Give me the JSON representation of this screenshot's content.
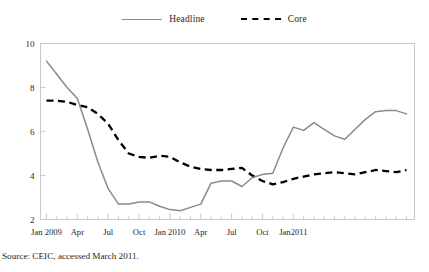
{
  "figure": {
    "source_note": "Source: CEIC, accessed March 2011."
  },
  "legend": {
    "items": [
      {
        "label": "Headline",
        "style": "solid",
        "color": "#8a8a8a"
      },
      {
        "label": "Core",
        "style": "dashed",
        "color": "#000000"
      }
    ]
  },
  "chart_data": {
    "type": "line",
    "title": "",
    "subtitle": "",
    "xlabel": "",
    "ylabel": "",
    "ylim": [
      2,
      10
    ],
    "yticks": [
      2,
      4,
      6,
      8,
      10
    ],
    "ytick_labels": [
      "2",
      "4",
      "6",
      "8",
      "10"
    ],
    "grid": false,
    "legend_position": "top-center",
    "x_minor_ticks": "monthly",
    "x": [
      "Jan 2009",
      "Feb 2009",
      "Mar 2009",
      "Apr 2009",
      "May 2009",
      "Jun 2009",
      "Jul 2009",
      "Aug 2009",
      "Sep 2009",
      "Oct 2009",
      "Nov 2009",
      "Dec 2009",
      "Jan 2010",
      "Feb 2010",
      "Mar 2010",
      "Apr 2010",
      "May 2010",
      "Jun 2010",
      "Jul 2010",
      "Aug 2010",
      "Sep 2010",
      "Oct 2010",
      "Nov 2010",
      "Dec 2010",
      "Jan 2011",
      "Feb 2011"
    ],
    "xtick_labels": [
      "Jan 2009",
      "Apr",
      "Jul",
      "Oct",
      "Jan 2010",
      "Apr",
      "Jul",
      "Oct",
      "Jan2011"
    ],
    "xtick_positions": [
      0,
      3,
      6,
      9,
      12,
      15,
      18,
      21,
      24
    ],
    "series": [
      {
        "name": "Headline",
        "color": "#8a8a8a",
        "style": "solid",
        "values": [
          9.2,
          8.6,
          8.0,
          7.5,
          6.1,
          4.6,
          3.4,
          2.7,
          2.7,
          2.8,
          2.6,
          2.4,
          2.5,
          2.7,
          3.7,
          3.8,
          3.5,
          4.0,
          4.1,
          5.2,
          6.2,
          6.05,
          6.4,
          6.0,
          5.65,
          6.1
        ]
      },
      {
        "name": "Core",
        "color": "#000000",
        "style": "dashed",
        "values": [
          7.4,
          7.4,
          7.35,
          7.2,
          7.1,
          6.8,
          6.3,
          5.6,
          5.0,
          4.85,
          4.8,
          4.9,
          4.75,
          4.55,
          4.35,
          4.25,
          4.2,
          4.25,
          4.35,
          4.3,
          3.95,
          3.75,
          3.6,
          3.7,
          3.85,
          3.95
        ]
      }
    ],
    "series_tail": [
      {
        "name": "Headline",
        "values": [
          6.5,
          6.9,
          6.95,
          6.95,
          6.8
        ]
      },
      {
        "name": "Core",
        "values": [
          4.05,
          4.1,
          4.15,
          4.1,
          4.05,
          4.1,
          4.25,
          4.2,
          4.15,
          4.2,
          4.25
        ]
      }
    ],
    "headline_full": [
      9.2,
      8.6,
      8.0,
      7.5,
      6.1,
      4.6,
      3.4,
      2.7,
      2.7,
      2.8,
      2.8,
      2.6,
      2.45,
      2.4,
      2.55,
      2.7,
      3.65,
      3.75,
      3.75,
      3.5,
      3.9,
      4.05,
      4.1,
      5.25,
      6.2,
      6.05,
      6.4,
      6.1,
      5.8,
      5.65,
      6.1,
      6.55,
      6.9,
      6.95,
      6.95,
      6.8
    ],
    "core_full": [
      7.4,
      7.4,
      7.35,
      7.2,
      7.1,
      6.8,
      6.35,
      5.6,
      5.0,
      4.85,
      4.8,
      4.9,
      4.85,
      4.6,
      4.4,
      4.3,
      4.25,
      4.25,
      4.3,
      4.35,
      4.0,
      3.75,
      3.6,
      3.7,
      3.85,
      3.95,
      4.05,
      4.1,
      4.15,
      4.1,
      4.05,
      4.15,
      4.25,
      4.2,
      4.15,
      4.25
    ]
  },
  "axes": {
    "ytick_labels": [
      "10",
      "8",
      "6",
      "4",
      "2"
    ],
    "xtick_labels": [
      "Jan 2009",
      "Apr",
      "Jul",
      "Oct",
      "Jan 2010",
      "Apr",
      "Jul",
      "Oct",
      "Jan2011"
    ]
  }
}
